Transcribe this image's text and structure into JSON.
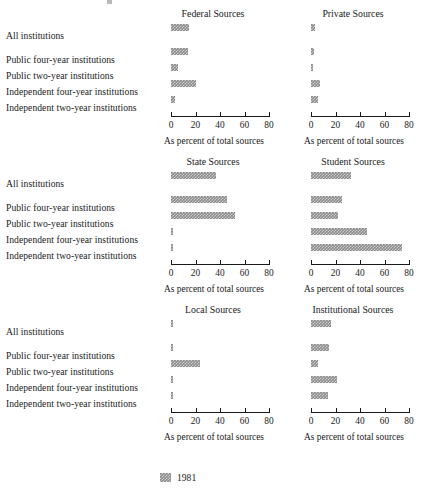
{
  "legend": {
    "series_label": "1981",
    "swatch_color": "#8a8a8a"
  },
  "categories": [
    "All institutions",
    "Public four-year institutions",
    "Public two-year institutions",
    "Independent four-year institutions",
    "Independent two-year institutions"
  ],
  "axis": {
    "caption": "As percent of total sources",
    "ticks": [
      "0",
      "20",
      "40",
      "60",
      "80"
    ],
    "min": 0,
    "max": 80
  },
  "panels": [
    {
      "title": "Federal Sources",
      "values": [
        15,
        14,
        6,
        20,
        3
      ]
    },
    {
      "title": "Private Sources",
      "values": [
        3,
        2.5,
        1.5,
        7,
        6
      ]
    },
    {
      "title": "State Sources",
      "values": [
        37,
        46,
        52,
        2,
        2
      ]
    },
    {
      "title": "Student Sources",
      "values": [
        33,
        25,
        22,
        46,
        74
      ]
    },
    {
      "title": "Local Sources",
      "values": [
        2,
        2,
        24,
        0.7,
        0.7
      ]
    },
    {
      "title": "Institutional Sources",
      "values": [
        16,
        15,
        6,
        21,
        14
      ]
    }
  ],
  "chart_data": {
    "type": "bar",
    "title": "",
    "orientation": "horizontal",
    "xlabel": "As percent of total sources",
    "ylabel": "",
    "xlim": [
      0,
      80
    ],
    "xticks": [
      0,
      20,
      40,
      60,
      80
    ],
    "grid": false,
    "legend_position": "bottom-left",
    "categories": [
      "All institutions",
      "Public four-year institutions",
      "Public two-year institutions",
      "Independent four-year institutions",
      "Independent two-year institutions"
    ],
    "series": [
      {
        "name": "1981",
        "panel": "Federal Sources",
        "values": [
          15,
          14,
          6,
          20,
          3
        ]
      },
      {
        "name": "1981",
        "panel": "Private Sources",
        "values": [
          3,
          2.5,
          1.5,
          7,
          6
        ]
      },
      {
        "name": "1981",
        "panel": "State Sources",
        "values": [
          37,
          46,
          52,
          2,
          2
        ]
      },
      {
        "name": "1981",
        "panel": "Student Sources",
        "values": [
          33,
          25,
          22,
          46,
          74
        ]
      },
      {
        "name": "1981",
        "panel": "Local Sources",
        "values": [
          2,
          2,
          24,
          0.7,
          0.7
        ]
      },
      {
        "name": "1981",
        "panel": "Institutional Sources",
        "values": [
          16,
          15,
          6,
          21,
          14
        ]
      }
    ],
    "panel_layout": {
      "rows": 3,
      "cols": 2
    }
  }
}
